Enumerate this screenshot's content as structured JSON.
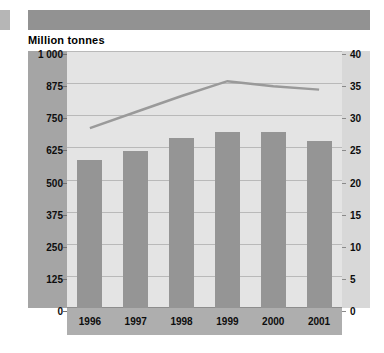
{
  "page": {
    "background_color": "#ffffff",
    "header_band_color": "#929292",
    "edge_marker_color": "#b6b6b6"
  },
  "title": "Million tonnes",
  "axes": {
    "left_ticks": [
      "1 000",
      "875",
      "750",
      "625",
      "500",
      "375",
      "250",
      "125",
      "0"
    ],
    "right_ticks": [
      "40",
      "35",
      "30",
      "25",
      "20",
      "15",
      "10",
      "5",
      "0"
    ]
  },
  "chart_data": {
    "type": "bar",
    "title": "Million tonnes",
    "xlabel": "",
    "ylabel": "Million tonnes",
    "categories": [
      "1996",
      "1997",
      "1998",
      "1999",
      "2000",
      "2001"
    ],
    "series": [
      {
        "name": "Million tonnes",
        "type": "bar",
        "axis": "left",
        "color": "#959595",
        "values": [
          575,
          612,
          660,
          686,
          686,
          649
        ]
      },
      {
        "name": "Trend line",
        "type": "line",
        "axis": "right",
        "color": "#9a9a9a",
        "values": [
          28.0,
          30.5,
          33.0,
          35.3,
          34.5,
          34.0
        ]
      }
    ],
    "ylim": [
      0,
      1000
    ],
    "y2lim": [
      0,
      40
    ],
    "ytick_step": 125,
    "y2tick_step": 5,
    "grid": true,
    "legend": "none"
  }
}
